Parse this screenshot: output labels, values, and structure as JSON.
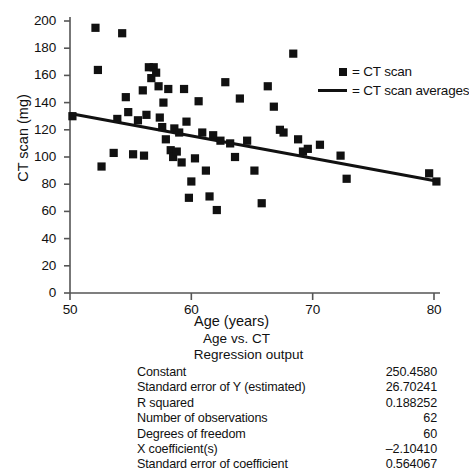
{
  "chart_data": {
    "type": "scatter",
    "title": "",
    "xlabel": "Age (years)",
    "ylabel": "CT scan (mg)",
    "xlim": [
      50,
      80
    ],
    "ylim": [
      0,
      200
    ],
    "xticks": [
      50,
      60,
      70,
      80
    ],
    "yticks": [
      0,
      20,
      40,
      60,
      80,
      100,
      120,
      140,
      160,
      180,
      200
    ],
    "grid": false,
    "legend_position": "upper-right",
    "series": [
      {
        "name": "CT scan",
        "type": "scatter",
        "marker": "square",
        "color": "#111111",
        "points": [
          [
            50.2,
            130
          ],
          [
            52.1,
            195
          ],
          [
            52.3,
            164
          ],
          [
            52.6,
            93
          ],
          [
            53.6,
            103
          ],
          [
            53.9,
            128
          ],
          [
            54.3,
            191
          ],
          [
            54.6,
            144
          ],
          [
            54.8,
            133
          ],
          [
            55.2,
            102
          ],
          [
            55.6,
            127
          ],
          [
            56.0,
            149
          ],
          [
            56.1,
            101
          ],
          [
            56.3,
            131
          ],
          [
            56.5,
            166
          ],
          [
            56.7,
            158
          ],
          [
            56.9,
            166
          ],
          [
            57.1,
            162
          ],
          [
            57.3,
            152
          ],
          [
            57.4,
            129
          ],
          [
            57.6,
            122
          ],
          [
            57.7,
            140
          ],
          [
            57.9,
            113
          ],
          [
            58.1,
            150
          ],
          [
            58.3,
            105
          ],
          [
            58.5,
            100
          ],
          [
            58.6,
            121
          ],
          [
            58.8,
            104
          ],
          [
            59.0,
            118
          ],
          [
            59.2,
            96
          ],
          [
            59.4,
            150
          ],
          [
            59.6,
            126
          ],
          [
            59.8,
            70
          ],
          [
            60.0,
            82
          ],
          [
            60.3,
            99
          ],
          [
            60.6,
            141
          ],
          [
            60.9,
            118
          ],
          [
            61.2,
            90
          ],
          [
            61.5,
            71
          ],
          [
            61.8,
            116
          ],
          [
            62.1,
            61
          ],
          [
            62.4,
            112
          ],
          [
            62.8,
            155
          ],
          [
            63.2,
            110
          ],
          [
            63.6,
            100
          ],
          [
            64.0,
            143
          ],
          [
            64.6,
            112
          ],
          [
            65.2,
            90
          ],
          [
            65.8,
            66
          ],
          [
            66.3,
            152
          ],
          [
            66.8,
            137
          ],
          [
            67.3,
            120
          ],
          [
            67.6,
            118
          ],
          [
            68.4,
            176
          ],
          [
            68.8,
            113
          ],
          [
            69.2,
            104
          ],
          [
            69.6,
            106
          ],
          [
            70.6,
            109
          ],
          [
            72.3,
            101
          ],
          [
            72.8,
            84
          ],
          [
            79.6,
            88
          ],
          [
            80.2,
            82
          ]
        ]
      },
      {
        "name": "CT scan averages",
        "type": "line",
        "color": "#111111",
        "endpoints": [
          [
            50,
            132
          ],
          [
            80.4,
            82
          ]
        ]
      }
    ],
    "legend": [
      {
        "key": "square",
        "label": "= CT scan"
      },
      {
        "key": "line",
        "label": "= CT scan averages"
      }
    ]
  },
  "regression": {
    "title": "Age vs. CT",
    "subtitle": "Regression output",
    "rows": [
      {
        "label": "Constant",
        "value": "250.4580"
      },
      {
        "label": "Standard error of Y (estimated)",
        "value": "26.70241"
      },
      {
        "label": "R squared",
        "value": "0.188252"
      },
      {
        "label": "Number of observations",
        "value": "62"
      },
      {
        "label": "Degrees of freedom",
        "value": "60"
      },
      {
        "label": "X coefficient(s)",
        "value": "–2.10410"
      },
      {
        "label": "Standard error of coefficient",
        "value": "0.564067"
      }
    ]
  }
}
